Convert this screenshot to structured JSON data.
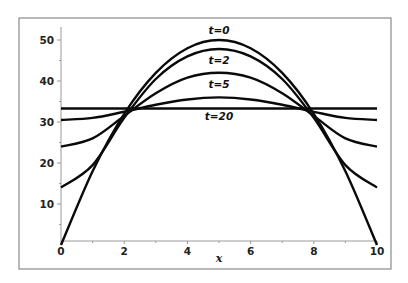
{
  "chart_data": {
    "type": "line",
    "title": "",
    "xlabel": "x",
    "ylabel": "",
    "xlim": [
      0,
      10
    ],
    "ylim": [
      0,
      52
    ],
    "grid": false,
    "legend": "inline curve labels",
    "x_ticks": [
      0,
      2,
      4,
      6,
      8,
      10
    ],
    "x_tick_labels": [
      "0",
      "2",
      "4",
      "6",
      "8",
      "10"
    ],
    "y_ticks": [
      10,
      20,
      30,
      40,
      50
    ],
    "y_tick_labels": [
      "10",
      "20",
      "30",
      "40",
      "50"
    ],
    "series": [
      {
        "name": "t=0",
        "label": "t=0",
        "x": [
          0,
          1,
          2,
          3,
          4,
          5,
          6,
          7,
          8,
          9,
          10
        ],
        "values": [
          0,
          18,
          32,
          42,
          48,
          50,
          48,
          42,
          32,
          18,
          0
        ]
      },
      {
        "name": "t=1",
        "label": "",
        "x": [
          0,
          1,
          2,
          3,
          4,
          5,
          6,
          7,
          8,
          9,
          10
        ],
        "values": [
          14,
          19.5,
          31,
          40.5,
          46,
          47.8,
          46,
          40.5,
          31,
          19.5,
          14
        ]
      },
      {
        "name": "t=2",
        "label": "t=2",
        "x": [
          0,
          1,
          2,
          3,
          4,
          5,
          6,
          7,
          8,
          9,
          10
        ],
        "values": [
          24,
          26,
          31.5,
          37,
          40.8,
          42,
          40.8,
          37,
          31.5,
          26,
          24
        ]
      },
      {
        "name": "t=5",
        "label": "t=5",
        "x": [
          0,
          1,
          2,
          3,
          4,
          5,
          6,
          7,
          8,
          9,
          10
        ],
        "values": [
          30.5,
          31,
          32.5,
          34.2,
          35.5,
          36,
          35.5,
          34.2,
          32.5,
          31,
          30.5
        ]
      },
      {
        "name": "t=20",
        "label": "t=20",
        "x": [
          0,
          1,
          2,
          3,
          4,
          5,
          6,
          7,
          8,
          9,
          10
        ],
        "values": [
          33.3,
          33.3,
          33.3,
          33.3,
          33.3,
          33.3,
          33.3,
          33.3,
          33.3,
          33.3,
          33.3
        ]
      }
    ],
    "annotations": [
      {
        "text": "t=0",
        "x": 5,
        "y": 51.5
      },
      {
        "text": "t=2",
        "x": 5,
        "y": 44.2
      },
      {
        "text": "t=5",
        "x": 5,
        "y": 38.2
      },
      {
        "text": "t=20",
        "x": 5,
        "y": 30.5
      }
    ]
  }
}
